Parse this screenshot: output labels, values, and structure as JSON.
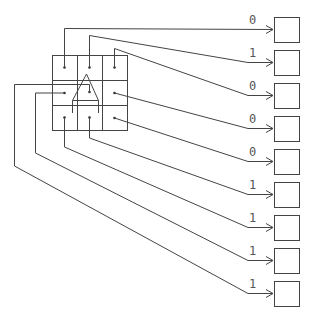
{
  "diagram": {
    "title": "",
    "grid": {
      "rows": 3,
      "cols": 3,
      "x": 52,
      "y": 55,
      "cell": 25,
      "shape": "house-outline"
    },
    "outputs": [
      {
        "label": "0",
        "source_cell": "r0c0"
      },
      {
        "label": "1",
        "source_cell": "r0c1"
      },
      {
        "label": "0",
        "source_cell": "r0c2"
      },
      {
        "label": "0",
        "source_cell": "r1c2"
      },
      {
        "label": "0",
        "source_cell": "r2c2"
      },
      {
        "label": "1",
        "source_cell": "r2c1"
      },
      {
        "label": "1",
        "source_cell": "r2c0"
      },
      {
        "label": "1",
        "source_cell": "r1c0"
      },
      {
        "label": "1",
        "source_cell": "r1c1"
      }
    ],
    "colors": {
      "stroke": "#444444",
      "text": "#555555",
      "background": "#ffffff"
    }
  }
}
